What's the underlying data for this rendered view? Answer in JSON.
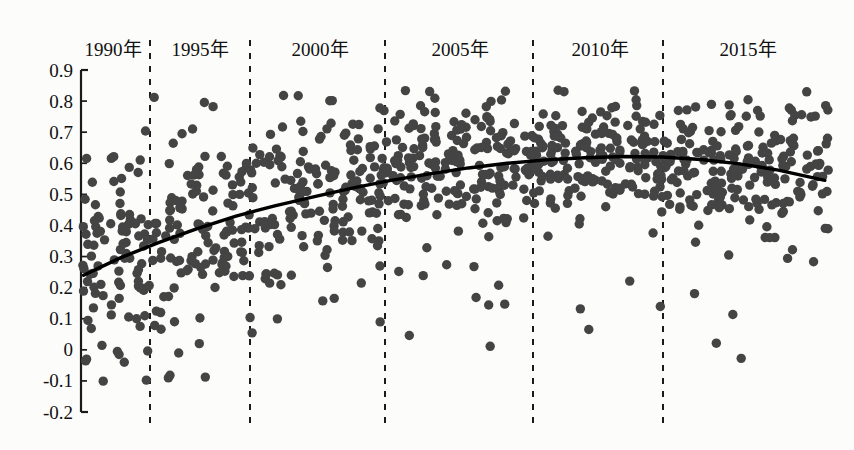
{
  "figure": {
    "background_color": "#fcfcfb",
    "point_color": "#444444",
    "trend_color": "#000000",
    "axis_color": "#1a1a1a",
    "divider_color": "#1a1a1a"
  },
  "chart_data": {
    "type": "scatter",
    "title": "",
    "subtitle": "",
    "xlabel": "",
    "ylabel": "",
    "xlim": [
      1988.5,
      2017.5
    ],
    "ylim": [
      -0.2,
      0.9
    ],
    "grid": false,
    "legend": null,
    "y_ticks": [
      "0.9",
      "0.8",
      "0.7",
      "0.6",
      "0.5",
      "0.4",
      "0.3",
      "0.2",
      "0.1",
      "0",
      "-0.1",
      "-0.2"
    ],
    "y_tick_values": [
      0.9,
      0.8,
      0.7,
      0.6,
      0.5,
      0.4,
      0.3,
      0.2,
      0.1,
      0,
      -0.1,
      -0.2
    ],
    "x_axis_labels": [
      "1990年",
      "1995年",
      "2000年",
      "2005年",
      "2010年",
      "2015年"
    ],
    "x_axis_label_values": [
      1990,
      1995,
      2000,
      2005,
      2010,
      2015
    ],
    "divider_lines": [
      1991.5,
      1995.2,
      1999.9,
      2005.2,
      2010.0,
      2014.0
    ],
    "trend_line": {
      "description": "quadratic fitted trend rising from 0.24 to peak 0.62 then declining to 0.545",
      "x": [
        1988.6,
        1990,
        1991.5,
        1993,
        1994.5,
        1996,
        1997.5,
        1999,
        2000.5,
        2002,
        2003.5,
        2005,
        2006.5,
        2008,
        2009.5,
        2011,
        2012.5,
        2014,
        2015.5,
        2017.3
      ],
      "y": [
        0.24,
        0.295,
        0.345,
        0.39,
        0.43,
        0.463,
        0.492,
        0.52,
        0.545,
        0.566,
        0.585,
        0.6,
        0.611,
        0.618,
        0.622,
        0.62,
        0.612,
        0.598,
        0.578,
        0.545
      ]
    },
    "points_note": "approximately 900 observations, annual bands 1989-2017; mean rises from ~0.33 in 1989 to ~0.62 around 2009 and eases to ~0.55 by 2017; spread widest in early years",
    "yearly_stats": [
      {
        "year": 1989,
        "n": 34,
        "mean": 0.33,
        "sd": 0.175
      },
      {
        "year": 1990,
        "n": 34,
        "mean": 0.33,
        "sd": 0.175
      },
      {
        "year": 1991,
        "n": 34,
        "mean": 0.345,
        "sd": 0.17
      },
      {
        "year": 1992,
        "n": 32,
        "mean": 0.355,
        "sd": 0.165
      },
      {
        "year": 1993,
        "n": 32,
        "mean": 0.38,
        "sd": 0.16
      },
      {
        "year": 1994,
        "n": 30,
        "mean": 0.41,
        "sd": 0.15
      },
      {
        "year": 1995,
        "n": 30,
        "mean": 0.44,
        "sd": 0.145
      },
      {
        "year": 1996,
        "n": 30,
        "mean": 0.465,
        "sd": 0.135
      },
      {
        "year": 1997,
        "n": 30,
        "mean": 0.49,
        "sd": 0.13
      },
      {
        "year": 1998,
        "n": 30,
        "mean": 0.515,
        "sd": 0.125
      },
      {
        "year": 1999,
        "n": 32,
        "mean": 0.54,
        "sd": 0.115
      },
      {
        "year": 2000,
        "n": 34,
        "mean": 0.56,
        "sd": 0.11
      },
      {
        "year": 2001,
        "n": 34,
        "mean": 0.572,
        "sd": 0.105
      },
      {
        "year": 2002,
        "n": 34,
        "mean": 0.582,
        "sd": 0.105
      },
      {
        "year": 2003,
        "n": 34,
        "mean": 0.592,
        "sd": 0.1
      },
      {
        "year": 2004,
        "n": 34,
        "mean": 0.6,
        "sd": 0.1
      },
      {
        "year": 2005,
        "n": 34,
        "mean": 0.606,
        "sd": 0.098
      },
      {
        "year": 2006,
        "n": 34,
        "mean": 0.612,
        "sd": 0.098
      },
      {
        "year": 2007,
        "n": 34,
        "mean": 0.616,
        "sd": 0.095
      },
      {
        "year": 2008,
        "n": 34,
        "mean": 0.62,
        "sd": 0.095
      },
      {
        "year": 2009,
        "n": 34,
        "mean": 0.622,
        "sd": 0.095
      },
      {
        "year": 2010,
        "n": 34,
        "mean": 0.62,
        "sd": 0.095
      },
      {
        "year": 2011,
        "n": 34,
        "mean": 0.616,
        "sd": 0.098
      },
      {
        "year": 2012,
        "n": 34,
        "mean": 0.61,
        "sd": 0.1
      },
      {
        "year": 2013,
        "n": 34,
        "mean": 0.602,
        "sd": 0.105
      },
      {
        "year": 2014,
        "n": 34,
        "mean": 0.592,
        "sd": 0.11
      },
      {
        "year": 2015,
        "n": 32,
        "mean": 0.58,
        "sd": 0.115
      },
      {
        "year": 2016,
        "n": 30,
        "mean": 0.566,
        "sd": 0.12
      },
      {
        "year": 2017,
        "n": 26,
        "mean": 0.55,
        "sd": 0.125
      }
    ]
  }
}
